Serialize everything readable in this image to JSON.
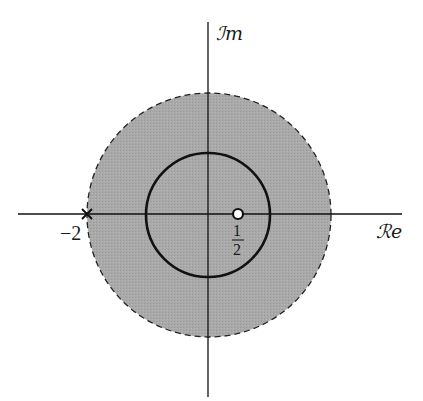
{
  "diagram": {
    "type": "complex-plane",
    "axes": {
      "imaginary_label": "ℐm",
      "real_label": "ℛe"
    },
    "region": {
      "description": "shaded disk |z| < 2 with dashed boundary",
      "fill_color": "#a9a9a9",
      "boundary": "dashed",
      "radius": 2
    },
    "unit_circle": {
      "radius": 1,
      "stroke": "solid"
    },
    "points": [
      {
        "name": "pole",
        "value": -2,
        "marker": "×",
        "label": "−2"
      },
      {
        "name": "zero",
        "value": 0.5,
        "marker": "open-circle",
        "label_num": "1",
        "label_den": "2"
      }
    ],
    "colors": {
      "shade": "#a9a9a9",
      "line": "#111111",
      "background": "#ffffff"
    }
  }
}
